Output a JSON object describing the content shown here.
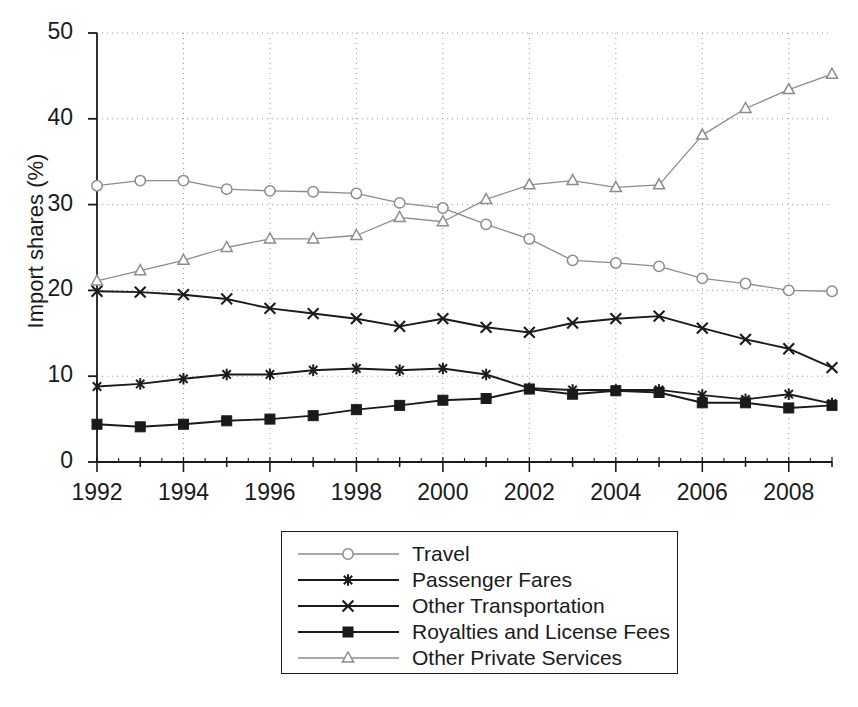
{
  "chart_data": {
    "type": "line",
    "title": "",
    "xlabel": "",
    "ylabel": "Import shares (%)",
    "xlim": [
      1992,
      2009
    ],
    "ylim": [
      0,
      50
    ],
    "grid": true,
    "legend_position": "below-center",
    "x": [
      1992,
      1993,
      1994,
      1995,
      1996,
      1997,
      1998,
      1999,
      2000,
      2001,
      2002,
      2003,
      2004,
      2005,
      2006,
      2007,
      2008,
      2009
    ],
    "xticks": [
      "1992",
      "1994",
      "1996",
      "1998",
      "2000",
      "2002",
      "2004",
      "2006",
      "2008"
    ],
    "yticks": [
      "0",
      "10",
      "20",
      "30",
      "40",
      "50"
    ],
    "series": [
      {
        "name": "Travel",
        "marker": "open-circle",
        "color": "#8c8c8c",
        "values": [
          32.2,
          32.8,
          32.8,
          31.8,
          31.6,
          31.5,
          31.3,
          30.2,
          29.6,
          27.7,
          26.0,
          23.5,
          23.2,
          22.8,
          21.4,
          20.8,
          20.0,
          19.9
        ]
      },
      {
        "name": "Passenger Fares",
        "marker": "asterisk",
        "color": "#1a1a1a",
        "values": [
          8.8,
          9.1,
          9.7,
          10.2,
          10.2,
          10.7,
          10.9,
          10.7,
          10.9,
          10.2,
          8.6,
          8.4,
          8.4,
          8.4,
          7.8,
          7.3,
          7.9,
          6.8
        ]
      },
      {
        "name": "Other Transportation",
        "marker": "x-cross",
        "color": "#1a1a1a",
        "values": [
          19.9,
          19.8,
          19.5,
          19.0,
          17.9,
          17.3,
          16.7,
          15.8,
          16.7,
          15.7,
          15.1,
          16.2,
          16.7,
          17.0,
          15.6,
          14.3,
          13.2,
          11.0
        ]
      },
      {
        "name": "Royalties and License Fees",
        "marker": "filled-square",
        "color": "#1a1a1a",
        "values": [
          4.4,
          4.1,
          4.4,
          4.8,
          5.0,
          5.4,
          6.1,
          6.6,
          7.2,
          7.4,
          8.5,
          7.9,
          8.3,
          8.1,
          6.9,
          6.9,
          6.3,
          6.6
        ]
      },
      {
        "name": "Other Private Services",
        "marker": "open-triangle",
        "color": "#8c8c8c",
        "values": [
          21.1,
          22.3,
          23.5,
          25.0,
          26.0,
          26.0,
          26.4,
          28.5,
          28.0,
          30.6,
          32.3,
          32.8,
          32.0,
          32.3,
          38.1,
          41.2,
          43.4,
          45.2
        ]
      }
    ]
  },
  "axes": {
    "y_label": "Import shares (%)",
    "y_ticks": [
      {
        "value": 50,
        "label": "50"
      },
      {
        "value": 40,
        "label": "40"
      },
      {
        "value": 30,
        "label": "30"
      },
      {
        "value": 20,
        "label": "20"
      },
      {
        "value": 10,
        "label": "10"
      },
      {
        "value": 0,
        "label": "0"
      }
    ],
    "x_ticks": [
      {
        "value": 1992,
        "label": "1992"
      },
      {
        "value": 1994,
        "label": "1994"
      },
      {
        "value": 1996,
        "label": "1996"
      },
      {
        "value": 1998,
        "label": "1998"
      },
      {
        "value": 2000,
        "label": "2000"
      },
      {
        "value": 2002,
        "label": "2002"
      },
      {
        "value": 2004,
        "label": "2004"
      },
      {
        "value": 2006,
        "label": "2006"
      },
      {
        "value": 2008,
        "label": "2008"
      }
    ]
  },
  "legend": {
    "items": [
      {
        "label": "Travel",
        "marker": "open-circle",
        "color": "#8c8c8c"
      },
      {
        "label": "Passenger Fares",
        "marker": "asterisk",
        "color": "#1a1a1a"
      },
      {
        "label": "Other Transportation",
        "marker": "x-cross",
        "color": "#1a1a1a"
      },
      {
        "label": "Royalties and License Fees",
        "marker": "filled-square",
        "color": "#1a1a1a"
      },
      {
        "label": "Other Private Services",
        "marker": "open-triangle",
        "color": "#8c8c8c"
      }
    ]
  }
}
